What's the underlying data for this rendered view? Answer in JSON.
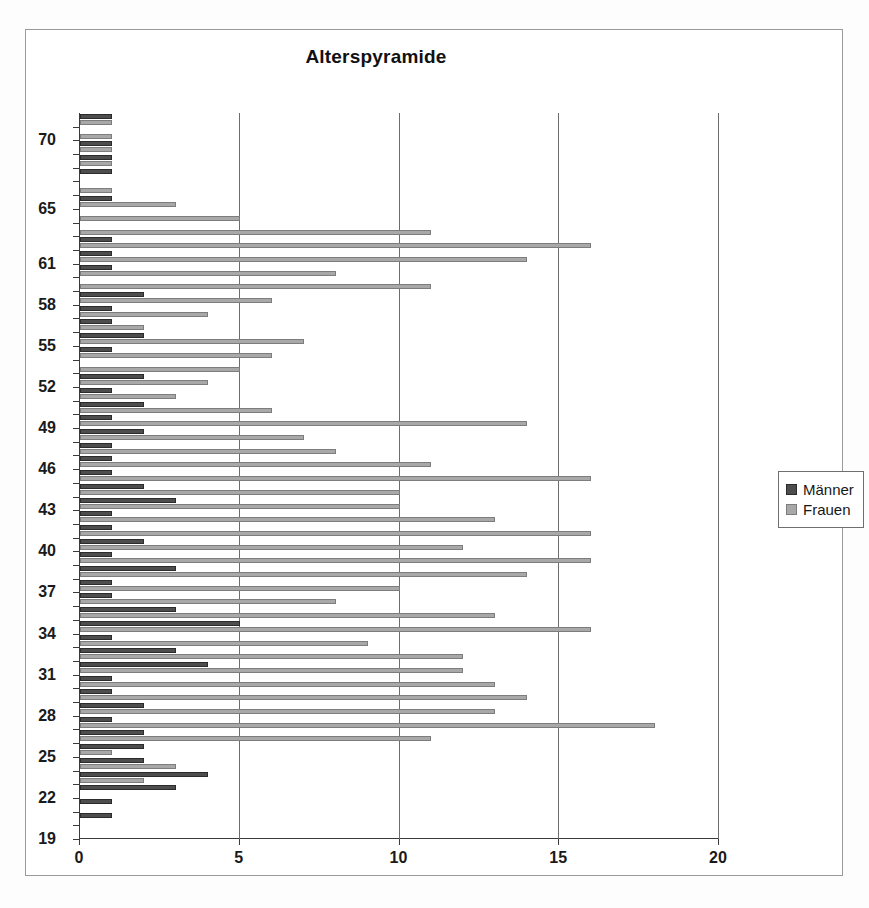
{
  "chart": {
    "title": "Alterspyramide",
    "legend": {
      "position": "right",
      "entries": [
        {
          "label": "Männer",
          "color": "#4d4d4d"
        },
        {
          "label": "Frauen",
          "color": "#a8a8a8"
        }
      ]
    }
  },
  "chart_data": {
    "type": "bar",
    "orientation": "horizontal",
    "title": "Alterspyramide",
    "xlabel": "",
    "ylabel": "",
    "xlim": [
      0,
      20
    ],
    "ylim": [
      19,
      71
    ],
    "xticks": [
      "0",
      "5",
      "10",
      "15",
      "20"
    ],
    "grid": "vertical",
    "legend_position": "right",
    "categories": [
      71,
      70,
      69,
      68,
      67,
      66,
      65,
      64,
      63,
      62,
      61,
      60,
      59,
      58,
      57,
      56,
      55,
      54,
      53,
      52,
      51,
      50,
      49,
      48,
      47,
      46,
      45,
      44,
      43,
      42,
      41,
      40,
      39,
      38,
      37,
      36,
      35,
      34,
      33,
      32,
      31,
      30,
      29,
      28,
      27,
      26,
      25,
      24,
      23,
      22,
      21,
      20,
      19
    ],
    "ytick_labels": [
      "70",
      "65",
      "61",
      "58",
      "55",
      "52",
      "49",
      "46",
      "43",
      "40",
      "37",
      "34",
      "31",
      "28",
      "25",
      "22",
      "19"
    ],
    "series": [
      {
        "name": "Männer",
        "color": "#4d4d4d",
        "values": [
          1,
          0,
          1,
          1,
          1,
          0,
          1,
          0,
          0,
          1,
          1,
          1,
          0,
          2,
          1,
          1,
          2,
          1,
          0,
          2,
          1,
          2,
          1,
          2,
          1,
          1,
          1,
          2,
          3,
          1,
          1,
          2,
          1,
          3,
          1,
          1,
          3,
          5,
          1,
          3,
          4,
          1,
          1,
          2,
          1,
          2,
          2,
          2,
          4,
          3,
          1,
          1,
          0
        ]
      },
      {
        "name": "Frauen",
        "color": "#a8a8a8",
        "values": [
          1,
          1,
          1,
          1,
          0,
          1,
          3,
          5,
          11,
          16,
          14,
          8,
          11,
          6,
          4,
          2,
          7,
          6,
          5,
          4,
          3,
          6,
          14,
          7,
          8,
          11,
          16,
          10,
          10,
          13,
          16,
          12,
          16,
          14,
          10,
          8,
          13,
          16,
          9,
          12,
          12,
          13,
          14,
          13,
          18,
          11,
          1,
          3,
          2,
          0,
          0,
          0,
          0
        ]
      }
    ]
  }
}
